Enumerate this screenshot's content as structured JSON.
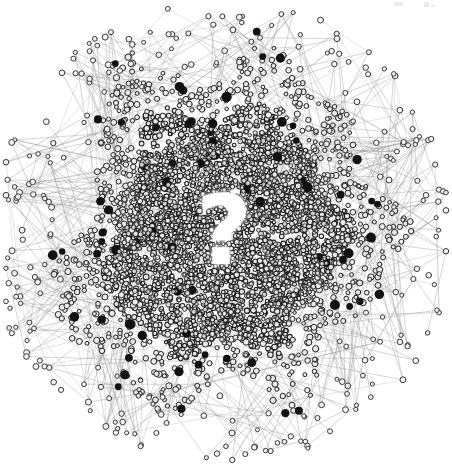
{
  "figure": {
    "background_color": "#ffffff",
    "width": 452,
    "height": 466,
    "center_overlay_text": "?",
    "center_overlay_color": "#ffffff"
  },
  "artifacts": {
    "top_right_mark_1": "",
    "top_right_mark_2": "",
    "top_right_mark_3": ""
  },
  "chart_data": {
    "type": "scatter",
    "subtitle": "",
    "xlabel": "",
    "ylabel": "",
    "xlim": [
      0,
      452
    ],
    "ylim": [
      0,
      466
    ],
    "grid": false,
    "legend": "none",
    "annotations": [
      {
        "text": "?",
        "x": 224,
        "y": 238,
        "color": "#ffffff",
        "font_size": 96,
        "font_weight": "bold"
      }
    ],
    "style": {
      "edge_color": "#9a9a9a",
      "edge_width": 0.6,
      "edge_opacity": 0.62,
      "node_ring_color": "#1c1c1c",
      "node_fill_color": "#e8e8e8",
      "hub_node_color": "#111111",
      "background": "#ffffff"
    },
    "layout": {
      "description": "force-directed radial blob, extremely dense core, sparse radiating periphery",
      "center_x": 224,
      "center_y": 233,
      "core_radius": 118,
      "blob_radius": 168,
      "periphery_max_radius": 230
    },
    "counts": {
      "core_nodes": 2600,
      "mid_nodes": 950,
      "periphery_nodes": 260,
      "hub_nodes": 72,
      "core_edges": 1400,
      "radial_edges": 420,
      "periphery_edges": 260
    },
    "node_sizes": {
      "core_min": 1.6,
      "core_max": 2.9,
      "mid_min": 1.8,
      "mid_max": 3.2,
      "periphery_min": 2.0,
      "periphery_max": 3.0,
      "hub_min": 3.2,
      "hub_max": 5.2
    },
    "series": [
      {
        "name": "core nodes",
        "marker": "ring",
        "count": 2600,
        "color": "#1c1c1c"
      },
      {
        "name": "mid nodes",
        "marker": "ring",
        "count": 950,
        "color": "#2a2a2a"
      },
      {
        "name": "periphery nodes",
        "marker": "ring",
        "count": 260,
        "color": "#3a3a3a"
      },
      {
        "name": "hub nodes",
        "marker": "filled-circle",
        "count": 72,
        "color": "#111111"
      },
      {
        "name": "edges",
        "marker": "line",
        "count": 2080,
        "color": "#9a9a9a"
      }
    ]
  }
}
